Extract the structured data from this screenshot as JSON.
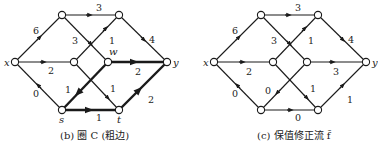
{
  "panels": [
    {
      "id": "b",
      "caption": "(b) 圈 C (粗边)",
      "nodes": {
        "x": {
          "label": "x"
        },
        "y": {
          "label": "y"
        },
        "w": {
          "label": "w"
        },
        "s": {
          "label": "s"
        },
        "t": {
          "label": "t"
        }
      },
      "edges": [
        {
          "from": "x",
          "to": "top_left",
          "value": "6",
          "bold": false
        },
        {
          "from": "top_left",
          "to": "top_right",
          "value": "3",
          "bold": false
        },
        {
          "from": "top_left",
          "to": "w",
          "value": "3",
          "bold": false
        },
        {
          "from": "mid_left",
          "to": "top_right",
          "value": "1",
          "bold": false
        },
        {
          "from": "top_right",
          "to": "y",
          "value": "4",
          "bold": false
        },
        {
          "from": "x",
          "to": "mid_left",
          "value": "2",
          "bold": false
        },
        {
          "from": "w",
          "to": "y",
          "value": "2",
          "bold": true
        },
        {
          "from": "w",
          "to": "s",
          "value": "1",
          "bold": true
        },
        {
          "from": "mid_left",
          "to": "t",
          "value": "1",
          "bold": false
        },
        {
          "from": "s",
          "to": "x",
          "value": "0",
          "bold": false
        },
        {
          "from": "s",
          "to": "t",
          "value": "1",
          "bold": true
        },
        {
          "from": "t",
          "to": "y",
          "value": "2",
          "bold": true
        }
      ]
    },
    {
      "id": "c",
      "caption": "(c) 保值修正流 f̃",
      "nodes": {
        "x": {
          "label": "x"
        },
        "y": {
          "label": "y"
        }
      },
      "edges": [
        {
          "from": "x",
          "to": "top_left",
          "value": "6"
        },
        {
          "from": "top_left",
          "to": "top_right",
          "value": "3"
        },
        {
          "from": "top_left",
          "to": "w",
          "value": "3"
        },
        {
          "from": "mid_left",
          "to": "top_right",
          "value": "1"
        },
        {
          "from": "top_right",
          "to": "y",
          "value": "4"
        },
        {
          "from": "x",
          "to": "mid_left",
          "value": "2"
        },
        {
          "from": "w",
          "to": "y",
          "value": "3"
        },
        {
          "from": "w",
          "to": "s",
          "value": "0"
        },
        {
          "from": "mid_left",
          "to": "t",
          "value": "1"
        },
        {
          "from": "s",
          "to": "x",
          "value": "0"
        },
        {
          "from": "s",
          "to": "t",
          "value": "0"
        },
        {
          "from": "t",
          "to": "y",
          "value": "1"
        }
      ]
    }
  ]
}
